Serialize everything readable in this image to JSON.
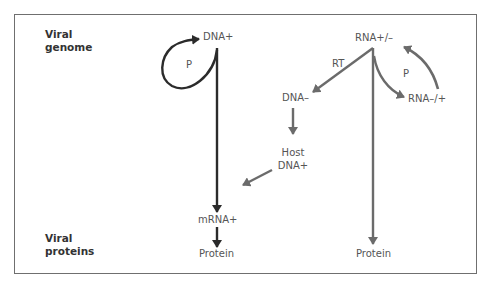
{
  "row_labels": {
    "top": [
      "Viral",
      "genome"
    ],
    "bottom": [
      "Viral",
      "proteins"
    ]
  },
  "left_pathway": {
    "genome": "DNA+",
    "self_loop_label": "P",
    "mrna": "mRNA+",
    "product": "Protein",
    "color": "#2b2b2b"
  },
  "right_pathway": {
    "genome": "RNA+/–",
    "rt_label": "RT",
    "dna_minus": "DNA–",
    "host_dna": [
      "Host",
      "DNA+"
    ],
    "rna_complement": "RNA–/+",
    "replication_label": "P",
    "product": "Protein",
    "color": "#6b6b6b"
  }
}
